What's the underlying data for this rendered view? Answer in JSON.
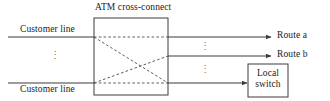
{
  "figure": {
    "type": "network-diagram",
    "background_color": "#ffffff",
    "line_color": "#3d3d3d",
    "text_color": "#1a1a1a",
    "title": "ATM cross-connect"
  },
  "labels": {
    "title": "ATM cross-connect",
    "customer_line_top": "Customer line",
    "customer_line_bottom": "Customer line",
    "route_a": "Route a",
    "route_b": "Route b",
    "local_switch_line1": "Local",
    "local_switch_line2": "switch",
    "ellipsis_glyph": "⋮"
  },
  "nodes": [
    {
      "name": "atm-cross-connect",
      "label": "ATM cross-connect",
      "shape": "rectangle",
      "x": 94,
      "y": 18,
      "width": 74,
      "height": 77
    },
    {
      "name": "local-switch",
      "label": "Local switch",
      "shape": "rectangle",
      "x": 248,
      "y": 64,
      "width": 40,
      "height": 33
    }
  ],
  "inputs": [
    {
      "name": "customer-line-top",
      "label": "Customer line",
      "y": 37,
      "x_start": 8,
      "x_end": 94,
      "label_position": "above"
    },
    {
      "name": "customer-line-bottom",
      "label": "Customer line",
      "y": 83,
      "x_start": 8,
      "x_end": 94,
      "label_position": "below"
    }
  ],
  "outputs": [
    {
      "name": "route-a",
      "label": "Route a",
      "y": 37,
      "x_start": 168,
      "x_end": 272,
      "arrow": true
    },
    {
      "name": "route-b",
      "label": "Route b",
      "y": 56,
      "x_start": 168,
      "x_end": 272,
      "arrow": true
    },
    {
      "name": "to-local-switch",
      "label": "",
      "y": 83,
      "x_start": 168,
      "x_end": 248,
      "arrow": true
    }
  ],
  "cross_connections": [
    {
      "name": "xc-top-straight",
      "from": [
        94,
        37
      ],
      "to": [
        168,
        37
      ],
      "style": "dashed"
    },
    {
      "name": "xc-top-to-bottom",
      "from": [
        94,
        37
      ],
      "to": [
        168,
        83
      ],
      "style": "dashed"
    },
    {
      "name": "xc-bottom-to-middle",
      "from": [
        94,
        83
      ],
      "to": [
        168,
        56
      ],
      "style": "dashed"
    },
    {
      "name": "xc-bottom-straight",
      "from": [
        94,
        83
      ],
      "to": [
        168,
        83
      ],
      "style": "dashed"
    }
  ],
  "ellipses": [
    {
      "name": "ellipsis-inputs",
      "x": 55,
      "y": 54
    },
    {
      "name": "ellipsis-outputs-upper",
      "x": 205,
      "y": 46
    },
    {
      "name": "ellipsis-outputs-lower",
      "x": 205,
      "y": 69
    }
  ]
}
